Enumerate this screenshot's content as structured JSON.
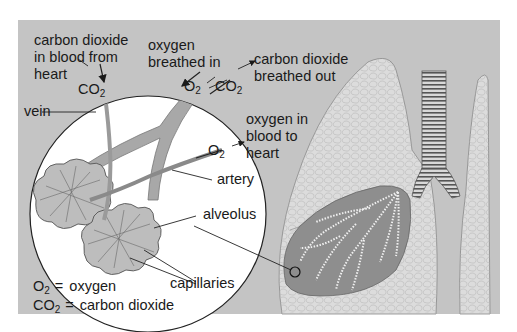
{
  "colors": {
    "page_bg": "#ffffff",
    "frame_bg": "#c4c4c4",
    "inset_circle": "#ffffff",
    "lung": "#dcdcdc",
    "lung_cutaway": "#8e8e8e",
    "vessel": "#a8a8a8",
    "text": "#1a1a1a"
  },
  "labels": {
    "co2_from_heart": [
      "carbon dioxide",
      "in blood from",
      "heart"
    ],
    "o2_breathed_in": [
      "oxygen",
      "breathed in"
    ],
    "co2_breathed_out": [
      "carbon dioxide",
      "breathed out"
    ],
    "o2_to_heart": [
      "oxygen in",
      "blood to",
      "heart"
    ],
    "vein": "vein",
    "artery": "artery",
    "alveolus": "alveolus",
    "capillaries": "capillaries"
  },
  "formulas": {
    "co2": {
      "base": "CO",
      "sub": "2"
    },
    "o2": {
      "base": "O",
      "sub": "2"
    }
  },
  "legend": [
    {
      "symbol_base": "O",
      "symbol_sub": "2",
      "equals": "=",
      "meaning": "oxygen"
    },
    {
      "symbol_base": "CO",
      "symbol_sub": "2",
      "equals": "=",
      "meaning": "carbon dioxide"
    }
  ]
}
